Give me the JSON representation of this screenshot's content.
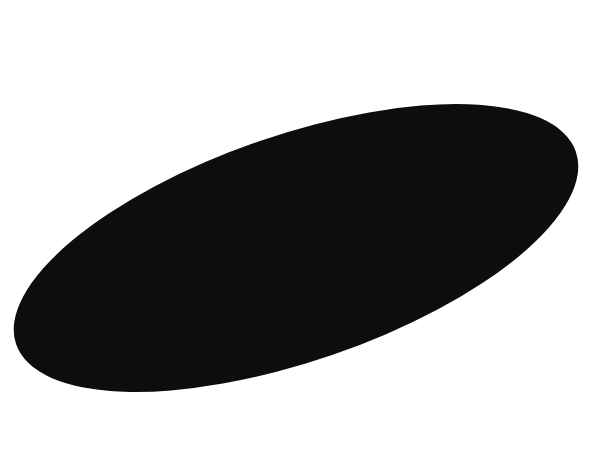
{
  "canvas": {
    "width": 613,
    "height": 453,
    "background": "#ffffff"
  },
  "shape": {
    "type": "ellipse",
    "cx": 296,
    "cy": 248,
    "rx": 296,
    "ry": 113,
    "rotation": -19,
    "fill": "#0d0d0d"
  }
}
